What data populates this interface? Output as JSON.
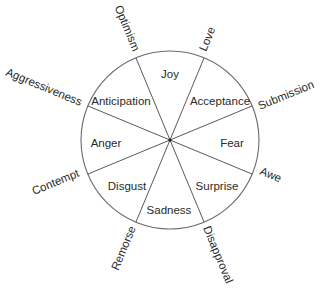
{
  "diagram": {
    "type": "emotion-wheel",
    "primary_emotions": [
      "Joy",
      "Acceptance",
      "Fear",
      "Surprise",
      "Sadness",
      "Disgust",
      "Anger",
      "Anticipation"
    ],
    "dyads": [
      "Love",
      "Submission",
      "Awe",
      "Disapproval",
      "Remorse",
      "Contempt",
      "Aggressiveness",
      "Optimism"
    ],
    "colors": {
      "line": "#5a5a5a",
      "text": "#2a2a2a",
      "background": "#ffffff"
    }
  }
}
